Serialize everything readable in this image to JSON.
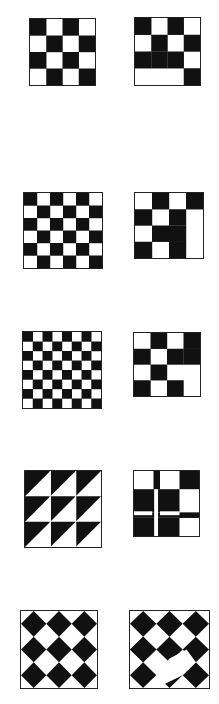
{
  "colors": {
    "ink": "#111111",
    "paper": "#ffffff",
    "border": "#222222"
  },
  "figures": [
    {
      "id": "p1-left",
      "kind": "grid",
      "rows": 4,
      "cols": 4,
      "box": [
        29,
        18,
        67,
        68
      ],
      "cells": [
        "BWBW",
        "WBWB",
        "BWBW",
        "WBWB"
      ]
    },
    {
      "id": "p1-right",
      "kind": "grid",
      "rows": 4,
      "cols": 4,
      "box": [
        134,
        17,
        67,
        69
      ],
      "cells": [
        "BWBW",
        "WBWB",
        "BBBW",
        "WWWB"
      ]
    },
    {
      "id": "p2-left",
      "kind": "grid",
      "rows": 6,
      "cols": 6,
      "box": [
        23,
        192,
        80,
        77
      ],
      "cells": [
        "BWBWBW",
        "WBWBWB",
        "BWBWBW",
        "WBWBWB",
        "BWBWBW",
        "WBWBWB"
      ]
    },
    {
      "id": "p2-right",
      "kind": "grid",
      "rows": 4,
      "cols": 4,
      "box": [
        134,
        192,
        70,
        67
      ],
      "cells": [
        "WBWB",
        "BWBW",
        "WBBW",
        "BWBW"
      ]
    },
    {
      "id": "p3-left",
      "kind": "grid",
      "rows": 8,
      "cols": 8,
      "box": [
        22,
        331,
        80,
        78
      ],
      "cells": [
        "BWBWBWBW",
        "WBWBWBWB",
        "BWBWBWBW",
        "WBWBWBWB",
        "BWBWBWBW",
        "WBWBWBWB",
        "BWBWBWBW",
        "WBWBWBWB"
      ]
    },
    {
      "id": "p3-right",
      "kind": "grid",
      "rows": 4,
      "cols": 4,
      "box": [
        133,
        332,
        68,
        65
      ],
      "cells": [
        "WBWB",
        "BWBB",
        "WBWW",
        "BWBW"
      ]
    },
    {
      "id": "p4-left",
      "kind": "triangles",
      "rows": 3,
      "cols": 3,
      "box": [
        24,
        470,
        78,
        78
      ]
    },
    {
      "id": "p4-right",
      "kind": "crossgrid",
      "box": [
        133,
        470,
        67,
        67
      ]
    },
    {
      "id": "p5-left",
      "kind": "diamonds",
      "box": [
        20,
        610,
        78,
        79
      ]
    },
    {
      "id": "p5-right",
      "kind": "diamonds-broken",
      "box": [
        129,
        610,
        81,
        79
      ]
    }
  ]
}
